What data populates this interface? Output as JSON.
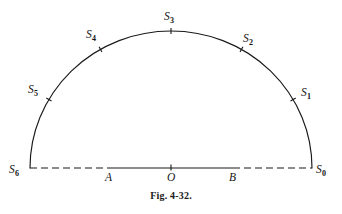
{
  "figure": {
    "caption": "Fig. 4-32.",
    "background_color": "#ffffff",
    "ink_color": "#1a1a1a",
    "width": 342,
    "height": 214
  },
  "geometry": {
    "center_x": 171,
    "center_y": 168,
    "radius_x": 141,
    "radius_y": 137,
    "baseline_y": 168,
    "baseline_left_x": 30,
    "baseline_right_x": 312,
    "tick_length": 6,
    "dash_pattern": "7 4"
  },
  "arc_points": [
    {
      "id": "S0",
      "letter": "S",
      "sub": "0",
      "angle_deg": 0,
      "label_x": 316,
      "label_y": 164,
      "tick": false
    },
    {
      "id": "S1",
      "letter": "S",
      "sub": "1",
      "angle_deg": 30,
      "label_x": 301,
      "label_y": 87,
      "tick": true
    },
    {
      "id": "S2",
      "letter": "S",
      "sub": "2",
      "angle_deg": 60,
      "label_x": 243,
      "label_y": 33,
      "tick": true
    },
    {
      "id": "S3",
      "letter": "S",
      "sub": "3",
      "angle_deg": 90,
      "label_x": 164,
      "label_y": 11,
      "tick": true
    },
    {
      "id": "S4",
      "letter": "S",
      "sub": "4",
      "angle_deg": 120,
      "label_x": 86,
      "label_y": 29,
      "tick": true
    },
    {
      "id": "S5",
      "letter": "S",
      "sub": "5",
      "angle_deg": 150,
      "label_x": 28,
      "label_y": 84,
      "tick": true
    },
    {
      "id": "S6",
      "letter": "S",
      "sub": "6",
      "angle_deg": 180,
      "label_x": 9,
      "label_y": 164,
      "tick": false
    }
  ],
  "baseline_points": [
    {
      "id": "A",
      "label": "A",
      "x": 109,
      "label_x": 105,
      "label_y": 172,
      "tick": false
    },
    {
      "id": "O",
      "label": "O",
      "x": 171,
      "label_x": 167,
      "label_y": 172,
      "tick": true
    },
    {
      "id": "B",
      "label": "B",
      "x": 233,
      "label_x": 229,
      "label_y": 172,
      "tick": false
    }
  ],
  "baseline_segments": [
    {
      "id": "left-dashed",
      "from_x": 30,
      "to_x": 109,
      "style": "dashed"
    },
    {
      "id": "middle-solid",
      "from_x": 109,
      "to_x": 233,
      "style": "solid"
    },
    {
      "id": "right-dashed",
      "from_x": 233,
      "to_x": 312,
      "style": "dashed"
    }
  ]
}
